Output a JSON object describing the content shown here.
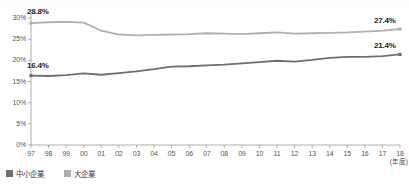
{
  "chart_data": {
    "type": "line",
    "title": "",
    "xlabel": "(年度)",
    "ylabel": "",
    "ylim": [
      0,
      30
    ],
    "ytick_labels": [
      "0%",
      "5%",
      "10%",
      "15%",
      "20%",
      "25%",
      "30%"
    ],
    "yticks": [
      0,
      5,
      10,
      15,
      20,
      25,
      30
    ],
    "grid": false,
    "legend_position": "bottom-left",
    "categories": [
      "97",
      "98",
      "99",
      "00",
      "01",
      "02",
      "03",
      "04",
      "05",
      "06",
      "07",
      "08",
      "09",
      "10",
      "11",
      "12",
      "13",
      "14",
      "15",
      "16",
      "17",
      "18"
    ],
    "series": [
      {
        "name": "中小企業",
        "color": "#6e6e6e",
        "values": [
          16.4,
          16.3,
          16.5,
          16.9,
          16.6,
          17.0,
          17.4,
          17.9,
          18.5,
          18.6,
          18.8,
          19.0,
          19.3,
          19.6,
          19.9,
          19.7,
          20.1,
          20.6,
          20.8,
          20.8,
          21.0,
          21.4
        ],
        "start_label": "16.4%",
        "end_label": "21.4%"
      },
      {
        "name": "大企業",
        "color": "#b0b0b0",
        "values": [
          28.8,
          29.0,
          29.1,
          28.9,
          27.0,
          26.1,
          25.9,
          26.0,
          26.1,
          26.2,
          26.4,
          26.3,
          26.2,
          26.4,
          26.6,
          26.3,
          26.4,
          26.5,
          26.6,
          26.8,
          27.0,
          27.4
        ],
        "start_label": "28.8%",
        "end_label": "27.4%"
      }
    ],
    "annotations": [
      {
        "text": "28.8%",
        "series": "大企業",
        "position": "start"
      },
      {
        "text": "16.4%",
        "series": "中小企業",
        "position": "start"
      },
      {
        "text": "27.4%",
        "series": "大企業",
        "position": "end"
      },
      {
        "text": "21.4%",
        "series": "中小企業",
        "position": "end"
      }
    ]
  },
  "legend": {
    "items": [
      {
        "label": "中小企業",
        "color": "#6e6e6e"
      },
      {
        "label": "大企業",
        "color": "#b0b0b0"
      }
    ]
  },
  "axis": {
    "x_unit": "(年度)"
  }
}
